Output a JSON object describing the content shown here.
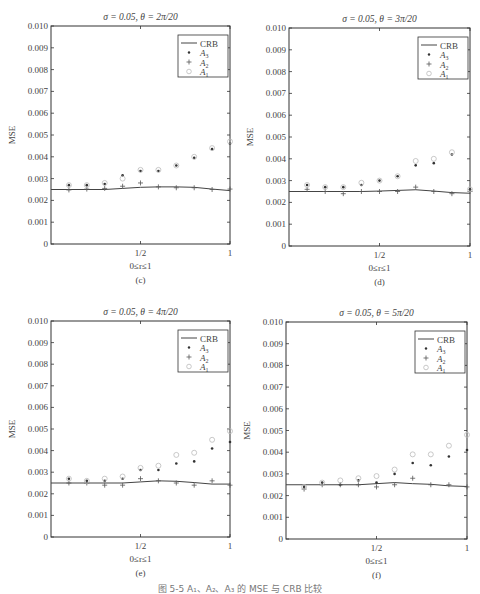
{
  "figure_caption": "图 5-5  A₁、A₂、A₃ 的 MSE 与 CRB 比较",
  "legend": {
    "items": [
      {
        "label": "CRB",
        "marker": "line"
      },
      {
        "label": "A3",
        "marker": "dot"
      },
      {
        "label": "A2",
        "marker": "plus"
      },
      {
        "label": "A1",
        "marker": "circle"
      }
    ]
  },
  "colors": {
    "crb": "#444444",
    "a3": "#333333",
    "a2": "#555555",
    "a1": "#bbbbbb",
    "axis": "#333333"
  },
  "chart_data": [
    {
      "type": "scatter",
      "panel_label": "(c)",
      "title": "σ = 0.05, θ = 2π/20",
      "xlabel": "0≤r≤1",
      "ylabel": "MSE",
      "xticks": [
        "1/2",
        "1"
      ],
      "yticks": [
        "0",
        "0.001",
        "0.002",
        "0.003",
        "0.004",
        "0.005",
        "0.006",
        "0.007",
        "0.008",
        "0.009",
        "0.010"
      ],
      "xlim": [
        0,
        1
      ],
      "ylim": [
        0,
        0.01
      ],
      "legend_position": "upper right",
      "x": [
        0.1,
        0.2,
        0.3,
        0.4,
        0.5,
        0.6,
        0.7,
        0.8,
        0.9,
        1.0
      ],
      "series": [
        {
          "name": "CRB",
          "style": "line",
          "values": [
            0.0025,
            0.0025,
            0.0025,
            0.00255,
            0.0026,
            0.00262,
            0.00262,
            0.0026,
            0.00252,
            0.00245
          ]
        },
        {
          "name": "A3",
          "style": "dot",
          "values": [
            0.0027,
            0.0027,
            0.00275,
            0.00315,
            0.00335,
            0.00335,
            0.0036,
            0.00395,
            0.00435,
            0.0046
          ]
        },
        {
          "name": "A2",
          "style": "plus",
          "values": [
            0.00248,
            0.00252,
            0.00255,
            0.00265,
            0.0028,
            0.00262,
            0.00258,
            0.00258,
            0.0025,
            0.00252
          ]
        },
        {
          "name": "A1",
          "style": "circle",
          "values": [
            0.0027,
            0.0027,
            0.0028,
            0.003,
            0.0034,
            0.0034,
            0.0036,
            0.004,
            0.0044,
            0.0047
          ]
        }
      ]
    },
    {
      "type": "scatter",
      "panel_label": "(d)",
      "title": "σ = 0.05, θ = 3π/20",
      "xlabel": "0≤r≤1",
      "ylabel": "MSE",
      "xticks": [
        "1/2",
        "1"
      ],
      "yticks": [
        "0",
        "0.001",
        "0.002",
        "0.003",
        "0.004",
        "0.005",
        "0.006",
        "0.007",
        "0.008",
        "0.009",
        "0.010"
      ],
      "xlim": [
        0,
        1
      ],
      "ylim": [
        0,
        0.01
      ],
      "legend_position": "upper right",
      "x": [
        0.1,
        0.2,
        0.3,
        0.4,
        0.5,
        0.6,
        0.7,
        0.8,
        0.9,
        1.0
      ],
      "series": [
        {
          "name": "CRB",
          "style": "line",
          "values": [
            0.0025,
            0.0025,
            0.0025,
            0.0025,
            0.00252,
            0.00255,
            0.00258,
            0.00252,
            0.00245,
            0.00242
          ]
        },
        {
          "name": "A3",
          "style": "dot",
          "values": [
            0.0028,
            0.0027,
            0.0027,
            0.0028,
            0.003,
            0.0032,
            0.0037,
            0.0038,
            0.0042,
            0.0026
          ]
        },
        {
          "name": "A2",
          "style": "plus",
          "values": [
            0.0026,
            0.0025,
            0.0024,
            0.0025,
            0.0025,
            0.0025,
            0.0027,
            0.0025,
            0.0024,
            0.0025
          ]
        },
        {
          "name": "A1",
          "style": "circle",
          "values": [
            0.0028,
            0.0027,
            0.0027,
            0.0029,
            0.003,
            0.0032,
            0.0039,
            0.004,
            0.0043,
            0.0026
          ]
        }
      ]
    },
    {
      "type": "scatter",
      "panel_label": "(e)",
      "title": "σ = 0.05, θ = 4π/20",
      "xlabel": "0≤r≤1",
      "ylabel": "MSE",
      "xticks": [
        "1/2",
        "1"
      ],
      "yticks": [
        "0",
        "0.001",
        "0.002",
        "0.003",
        "0.004",
        "0.005",
        "0.006",
        "0.007",
        "0.008",
        "0.009",
        "0.010"
      ],
      "xlim": [
        0,
        1
      ],
      "ylim": [
        0,
        0.01
      ],
      "legend_position": "upper right",
      "x": [
        0.1,
        0.2,
        0.3,
        0.4,
        0.5,
        0.6,
        0.7,
        0.8,
        0.9,
        1.0
      ],
      "series": [
        {
          "name": "CRB",
          "style": "line",
          "values": [
            0.0025,
            0.0025,
            0.0025,
            0.0025,
            0.00255,
            0.0026,
            0.00258,
            0.00252,
            0.00245,
            0.00245
          ]
        },
        {
          "name": "A3",
          "style": "dot",
          "values": [
            0.0027,
            0.0026,
            0.0026,
            0.0027,
            0.0031,
            0.0031,
            0.0034,
            0.0035,
            0.0041,
            0.0044
          ]
        },
        {
          "name": "A2",
          "style": "plus",
          "values": [
            0.0025,
            0.0025,
            0.0024,
            0.0024,
            0.0027,
            0.0026,
            0.0025,
            0.0024,
            0.0026,
            0.0024
          ]
        },
        {
          "name": "A1",
          "style": "circle",
          "values": [
            0.0027,
            0.0026,
            0.0027,
            0.0028,
            0.0032,
            0.0033,
            0.0038,
            0.0039,
            0.0045,
            0.0049
          ]
        }
      ]
    },
    {
      "type": "scatter",
      "panel_label": "(f)",
      "title": "σ = 0.05, θ = 5π/20",
      "xlabel": "0≤r≤1",
      "ylabel": "MSE",
      "xticks": [
        "1/2",
        "1"
      ],
      "yticks": [
        "0",
        "0.001",
        "0.002",
        "0.003",
        "0.004",
        "0.005",
        "0.006",
        "0.007",
        "0.008",
        "0.009",
        "0.010"
      ],
      "xlim": [
        0,
        1
      ],
      "ylim": [
        0,
        0.01
      ],
      "legend_position": "upper right",
      "x": [
        0.1,
        0.2,
        0.3,
        0.4,
        0.5,
        0.6,
        0.7,
        0.8,
        0.9,
        1.0
      ],
      "series": [
        {
          "name": "CRB",
          "style": "line",
          "values": [
            0.0025,
            0.0025,
            0.0025,
            0.0025,
            0.00255,
            0.0026,
            0.00255,
            0.00252,
            0.00245,
            0.00242
          ]
        },
        {
          "name": "A3",
          "style": "dot",
          "values": [
            0.0024,
            0.0026,
            0.0025,
            0.0027,
            0.0026,
            0.003,
            0.0035,
            0.0034,
            0.0038,
            0.0041
          ]
        },
        {
          "name": "A2",
          "style": "plus",
          "values": [
            0.0023,
            0.0025,
            0.0025,
            0.0025,
            0.0024,
            0.0025,
            0.0028,
            0.0025,
            0.0025,
            0.0024
          ]
        },
        {
          "name": "A1",
          "style": "circle",
          "values": [
            0.0024,
            0.0026,
            0.0027,
            0.0028,
            0.0029,
            0.0032,
            0.0039,
            0.0039,
            0.0043,
            0.0048
          ]
        }
      ]
    }
  ]
}
